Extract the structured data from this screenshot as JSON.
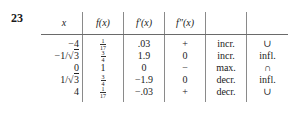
{
  "exercise_number": "23",
  "table": {
    "headers": [
      "x",
      "f(x)",
      "f′(x)",
      "f″(x)",
      "",
      ""
    ],
    "rows": [
      {
        "x": "−4",
        "f": {
          "num": "1",
          "den": "17"
        },
        "fp": ".03",
        "fpp": "+",
        "mono": "incr.",
        "conc": "∪"
      },
      {
        "x": {
          "prefix": "−1/",
          "rad": "3"
        },
        "f": {
          "num": "3",
          "den": "4"
        },
        "fp": "1.9",
        "fpp": "0",
        "mono": "incr.",
        "conc": "infl."
      },
      {
        "x": "0",
        "f": "1",
        "fp": "0",
        "fpp": "−",
        "mono": "max.",
        "conc": "∩"
      },
      {
        "x": {
          "prefix": "1/",
          "rad": "3"
        },
        "f": {
          "num": "3",
          "den": "4"
        },
        "fp": "−1.9",
        "fpp": "0",
        "mono": "decr.",
        "conc": "infl."
      },
      {
        "x": "4",
        "f": {
          "num": "1",
          "den": "17"
        },
        "fp": "−.03",
        "fpp": "+",
        "mono": "decr.",
        "conc": "∪"
      }
    ]
  }
}
